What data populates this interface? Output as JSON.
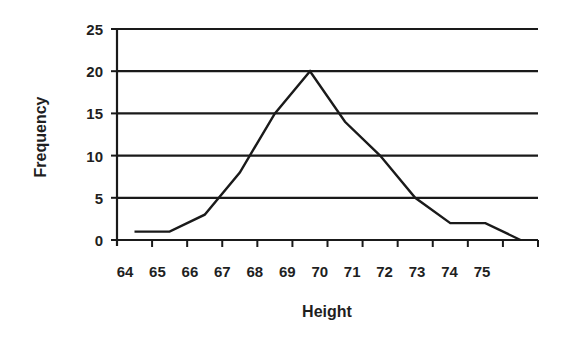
{
  "chart_data": {
    "type": "line",
    "title": "",
    "xlabel": "Height",
    "ylabel": "Frequency",
    "categories": [
      "64",
      "65",
      "66",
      "67",
      "68",
      "69",
      "70",
      "71",
      "72",
      "73",
      "74",
      "75"
    ],
    "series": [
      {
        "name": "Frequency",
        "values": [
          1,
          1,
          3,
          8,
          15,
          20,
          14,
          10,
          5,
          2,
          2,
          0
        ]
      }
    ],
    "y_ticks": [
      0,
      5,
      10,
      15,
      20,
      25
    ],
    "ylim": [
      0,
      25
    ],
    "grid": {
      "horizontal": true,
      "vertical": false
    },
    "legend": null,
    "colors": {
      "line": "#1a1a1a",
      "grid": "#1a1a1a",
      "text": "#1f1f1f",
      "background": "#ffffff"
    }
  }
}
